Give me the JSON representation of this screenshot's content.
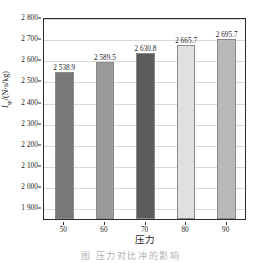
{
  "chart_data": {
    "type": "bar",
    "title": "",
    "xlabel": "压力",
    "ylabel": "Isp /(N·s/kg)",
    "ylabel_parts": {
      "variable": "I",
      "subscript": "sp",
      "units": "/(N·s/kg)"
    },
    "categories": [
      "50",
      "60",
      "70",
      "80",
      "90"
    ],
    "values": [
      2538.9,
      2589.5,
      2630.8,
      2665.7,
      2695.7
    ],
    "value_labels": [
      "2 538.9",
      "2 589.5",
      "2 630.8",
      "2 665.7",
      "2 695.7"
    ],
    "ylim": [
      1845,
      2800
    ],
    "yticks": [
      1900,
      2000,
      2100,
      2200,
      2300,
      2400,
      2500,
      2600,
      2700,
      2800
    ],
    "ytick_labels": [
      "1 900",
      "2 000",
      "2 100",
      "2 200",
      "2 300",
      "2 400",
      "2 500",
      "2 600",
      "2 700",
      "2 800"
    ],
    "grid": true,
    "legend": "none",
    "bar_colors": [
      "#787878",
      "#9a9a9a",
      "#5c5c5c",
      "#e0e0e0",
      "#b9b9b9"
    ],
    "frame_color": "#2b2b2b",
    "grid_color": "#d8d8d8"
  },
  "caption": {
    "text": "图     压力对比冲的影响"
  }
}
